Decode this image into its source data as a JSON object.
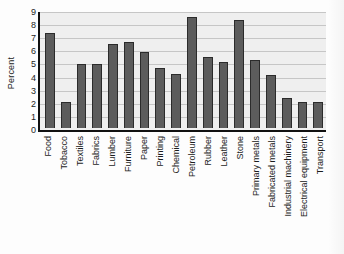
{
  "chart_data": {
    "type": "bar",
    "title": "",
    "xlabel": "",
    "ylabel": "Percent",
    "ylim": [
      0,
      9
    ],
    "ytick_step": 1,
    "yticks": [
      "9",
      "8",
      "7",
      "6",
      "5",
      "4",
      "3",
      "2",
      "1",
      "0"
    ],
    "grid": true,
    "legend": "none",
    "bar_color": "#5c5c5c",
    "bar_edge_color": "#2b2b2b",
    "plot_background": "#efefef",
    "axis_color": "#111111",
    "gridline_color": "#c6c6c6",
    "categories": [
      "Food",
      "Tobacco",
      "Textiles",
      "Fabrics",
      "Lumber",
      "Furniture",
      "Paper",
      "Printing",
      "Chemical",
      "Petroleum",
      "Rubber",
      "Leather",
      "Stone",
      "Primary metals",
      "Fabricated metals",
      "Industrial machinery",
      "Electrical equipment",
      "Transport"
    ],
    "values": [
      7.4,
      2.05,
      5.0,
      5.0,
      6.55,
      6.7,
      5.9,
      4.65,
      4.2,
      8.6,
      5.5,
      5.15,
      8.4,
      5.25,
      4.15,
      2.35,
      2.0,
      2.0
    ]
  }
}
